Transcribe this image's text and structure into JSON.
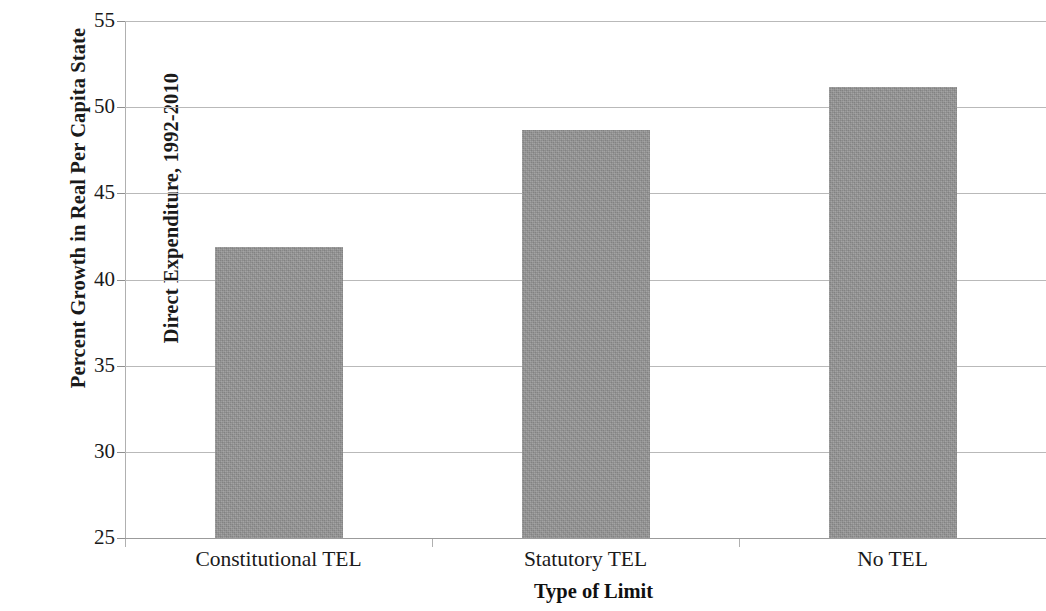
{
  "chart_data": {
    "type": "bar",
    "title": "",
    "subtitle": "",
    "xlabel": "Type of Limit",
    "ylabel": "Percent Growth in Real Per Capita State Direct Expenditure, 1992-2010",
    "ylabel_lines": [
      "Percent Growth in Real Per Capita State",
      "Direct Expenditure, 1992-2010"
    ],
    "categories": [
      "Constitutional TEL",
      "Statutory TEL",
      "No TEL"
    ],
    "values": [
      41.9,
      48.7,
      51.2
    ],
    "ylim": [
      25,
      55
    ],
    "yticks": [
      25,
      30,
      35,
      40,
      45,
      50,
      55
    ],
    "ytick_labels": [
      "25",
      "30",
      "35",
      "40",
      "45",
      "50",
      "55"
    ],
    "grid": true,
    "grid_axis": "y",
    "legend": false,
    "legend_position": "none",
    "bar_color": "#969696",
    "gridline_color": "#b9b9b9",
    "axis_color": "#b0b0b0",
    "text_color": "#1a1a1a",
    "background": "#ffffff"
  }
}
